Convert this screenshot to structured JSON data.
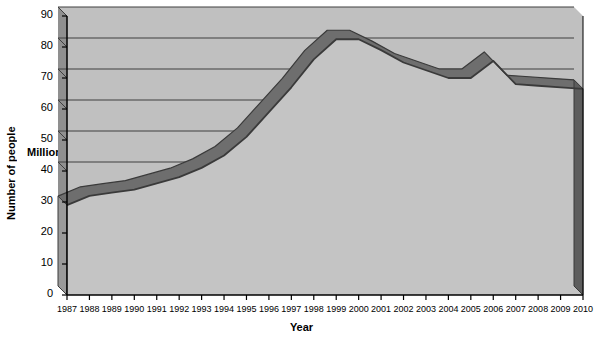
{
  "chart_data": {
    "type": "area",
    "title": "",
    "xlabel": "Year",
    "ylabel": "Number of people",
    "y_units": "Millions",
    "ylim": [
      0,
      90
    ],
    "ytick_step": 10,
    "yticks": [
      0,
      10,
      20,
      30,
      40,
      50,
      60,
      70,
      80,
      90
    ],
    "ytick_labels": [
      "0",
      "10",
      "20",
      "30",
      "40",
      "50",
      "60",
      "70",
      "80",
      "90"
    ],
    "grid": true,
    "gridlines_at": [
      40,
      50,
      60,
      70,
      80,
      90
    ],
    "legend": "none",
    "categories": [
      "1987",
      "1988",
      "1989",
      "1990",
      "1991",
      "1992",
      "1993",
      "1994",
      "1995",
      "1996",
      "1997",
      "1998",
      "1999",
      "2000",
      "2001",
      "2002",
      "2003",
      "2004",
      "2005",
      "2006",
      "2007",
      "2008",
      "2009",
      "2010"
    ],
    "series": [
      {
        "name": "Number of people",
        "values": [
          29,
          32,
          33,
          34,
          36,
          38,
          41,
          45,
          51,
          59,
          67,
          76,
          82.5,
          82.5,
          79,
          75,
          72.5,
          70,
          70,
          75.5,
          68,
          67.5,
          67,
          66.5
        ]
      }
    ]
  },
  "colors": {
    "plot_fill": "#c0c0c0",
    "area_fill": "#c4c4c4",
    "line": "#3a3a3a",
    "grid": "#3f3f3f",
    "axis": "#000000",
    "wall_side": "#8f8f8f",
    "background": "#ffffff"
  }
}
